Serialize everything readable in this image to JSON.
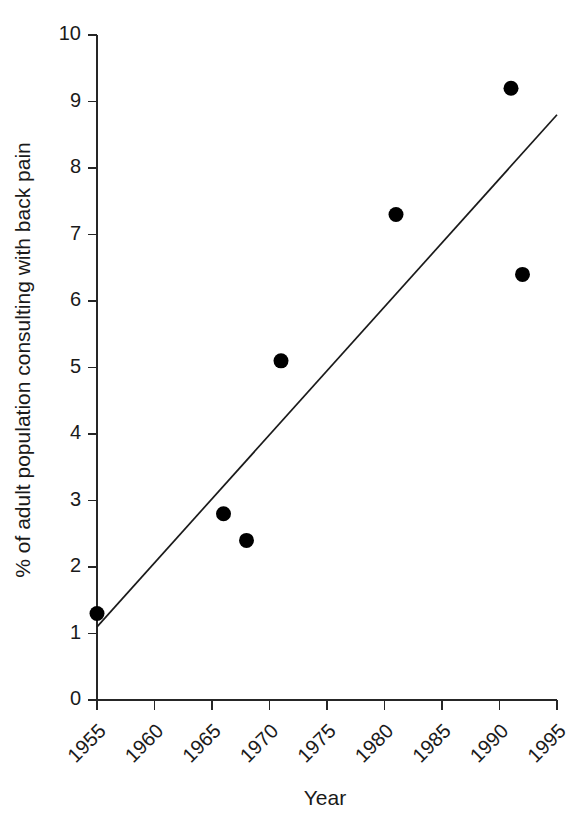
{
  "chart_data": {
    "type": "scatter",
    "title": "",
    "xlabel": "Year",
    "ylabel": "% of adult population consulting with back pain",
    "xlim": [
      1955,
      1995
    ],
    "ylim": [
      0,
      10
    ],
    "grid": false,
    "legend": false,
    "xticks": [
      1955,
      1960,
      1965,
      1970,
      1975,
      1980,
      1985,
      1990,
      1995
    ],
    "xtick_labels": [
      "1955",
      "1960",
      "1965",
      "1970",
      "1975",
      "1980",
      "1985",
      "1990",
      "1995"
    ],
    "xtick_label_rotation": -45,
    "yticks": [
      0,
      1,
      2,
      3,
      4,
      5,
      6,
      7,
      8,
      9,
      10
    ],
    "ytick_labels": [
      "0",
      "1",
      "2",
      "3",
      "4",
      "5",
      "6",
      "7",
      "8",
      "9",
      "10"
    ],
    "series": [
      {
        "name": "observations",
        "marker": "filled-circle",
        "color": "#000000",
        "points": [
          {
            "x": 1955,
            "y": 1.3
          },
          {
            "x": 1966,
            "y": 2.8
          },
          {
            "x": 1968,
            "y": 2.4
          },
          {
            "x": 1971,
            "y": 5.1
          },
          {
            "x": 1981,
            "y": 7.3
          },
          {
            "x": 1991,
            "y": 9.2
          },
          {
            "x": 1992,
            "y": 6.4
          }
        ]
      },
      {
        "name": "trend-line",
        "marker": "none",
        "color": "#1a1a1a",
        "points": [
          {
            "x": 1955,
            "y": 1.1
          },
          {
            "x": 1995,
            "y": 8.8
          }
        ]
      }
    ]
  }
}
